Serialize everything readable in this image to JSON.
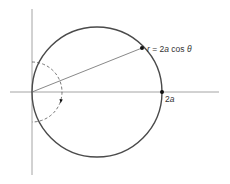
{
  "diagram": {
    "type": "polar-curve",
    "curve_label": {
      "prefix": "r",
      "equals": " = 2",
      "a": "a",
      "cos": " cos ",
      "theta": "θ"
    },
    "point_label": {
      "coef": "2",
      "a": "a"
    },
    "elements": [
      "vertical-axis",
      "horizontal-axis",
      "circle r = 2a cos θ",
      "radius line from origin to point on circle",
      "dashed arc with arrow indicating theta sweep",
      "marked point at (2a, 0)"
    ],
    "colors": {
      "axis": "#9a9a9a",
      "curve": "#4a4a4a",
      "point": "#111111"
    }
  }
}
